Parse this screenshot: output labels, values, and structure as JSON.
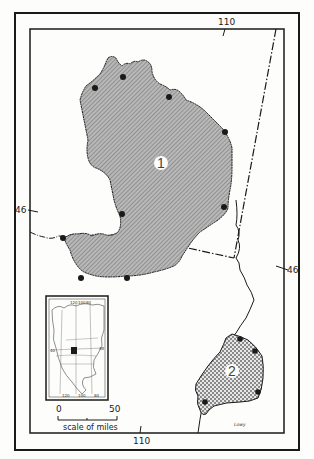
{
  "map": {
    "type": "species range map",
    "colors": {
      "paper": "#fdfdfb",
      "ink": "#1a1a1a",
      "region1_fill": "#a9a9a9",
      "region2_fill": "#d4d4d4"
    },
    "graticule": {
      "longitude_top": "110",
      "longitude_bottom": "110",
      "latitude_left": "46",
      "latitude_right": "46"
    },
    "regions": [
      {
        "id": "1",
        "label": "1",
        "pattern": "fine diagonal hatch",
        "locality_dots": 10
      },
      {
        "id": "2",
        "label": "2",
        "pattern": "cross-hatch",
        "locality_dots": 4
      }
    ],
    "inset": {
      "description": "North America locator map",
      "graticule_labels": [
        "120",
        "100",
        "80",
        "40",
        "40",
        "120",
        "100",
        "80"
      ]
    },
    "scale_bar": {
      "start": "0",
      "end": "50",
      "caption": "scale of miles"
    },
    "artist_signature": "Lowy"
  }
}
